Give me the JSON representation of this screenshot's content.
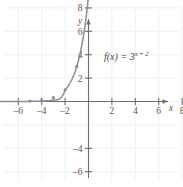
{
  "figure": {
    "name": "exponential-function-graph",
    "background_color": "#ffffff",
    "grid_color": "#f0f0f2",
    "axis_color": "#6d6d70",
    "curve_color": "#8c8c8f",
    "text_color": "#58585a"
  },
  "labels": {
    "x_axis_name": "x",
    "y_axis_name": "y",
    "function_label": "f(x) = 3",
    "function_exponent": "x + 2",
    "function_full": "f(x) = 3^(x + 2)"
  },
  "chart_data": {
    "type": "line",
    "title": "",
    "subtitle": "",
    "xlabel": "x",
    "ylabel": "y",
    "xlim": [
      -11.5,
      11.5
    ],
    "ylim": [
      -11.5,
      11.5
    ],
    "grid": true,
    "legend": "none",
    "annotations": [
      {
        "text": "f(x) = 3^(x + 2)",
        "x": 2.2,
        "y": 7.0
      }
    ],
    "x_ticks": [
      -10,
      -8,
      -6,
      -4,
      -2,
      2,
      4,
      6,
      8,
      10
    ],
    "x_tick_labels": [
      "–10",
      "–8",
      "–6",
      "–4",
      "–2",
      "2",
      "4",
      "6",
      "8",
      "10"
    ],
    "y_ticks": [
      -10,
      -8,
      -6,
      -4,
      2,
      4,
      6,
      8,
      10
    ],
    "y_tick_labels": [
      "–10",
      "–8",
      "–6",
      "–4",
      "2",
      "4",
      "6",
      "8",
      "10"
    ],
    "series": [
      {
        "name": "f(x) = 3^(x + 2)",
        "equation": "y = 3^(x + 2)",
        "color": "#8c8c8f",
        "marked_points": [
          {
            "x": -5,
            "y": 0.04
          },
          {
            "x": -4,
            "y": 0.11
          },
          {
            "x": -3,
            "y": 0.33
          },
          {
            "x": -2,
            "y": 1
          },
          {
            "x": -1,
            "y": 3
          },
          {
            "x": 0,
            "y": 9
          }
        ],
        "x": [
          -11,
          -10,
          -9,
          -8,
          -7,
          -6,
          -5,
          -4,
          -3,
          -2.5,
          -2,
          -1.5,
          -1,
          -0.5,
          0,
          0.2
        ],
        "values": [
          1.69e-05,
          5.08e-05,
          0.000152,
          0.000457,
          0.00137,
          0.00412,
          0.0123,
          0.037,
          0.111,
          0.192,
          1,
          1.732,
          3,
          5.196,
          9,
          11.2
        ]
      }
    ]
  }
}
